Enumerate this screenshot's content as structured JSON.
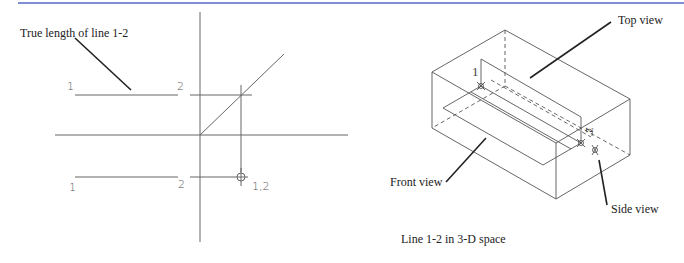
{
  "figure": {
    "left_panel": {
      "annotation": "True length of line 1-2",
      "upper_view": {
        "point_1_label": "1",
        "point_2_label": "2"
      },
      "lower_view": {
        "point_1_label": "1",
        "point_2_label": "2",
        "point_view_label": "1,2"
      }
    },
    "right_panel": {
      "labels": {
        "top_view": "Top view",
        "front_view": "Front view",
        "side_view": "Side view",
        "point_1": "1",
        "point_2": "2"
      },
      "caption": "Line 1-2 in 3-D space"
    },
    "colors": {
      "header_rule": "#7f8fd6",
      "line": "#555555",
      "leader": "#222222"
    }
  }
}
